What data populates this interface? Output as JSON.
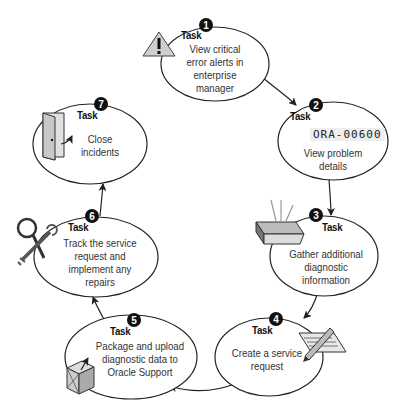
{
  "diagram": {
    "colors": {
      "stroke": "#222222",
      "badge": "#111111",
      "icon_gray": "#cccccc"
    },
    "steps": [
      {
        "number": "1",
        "label": "Task",
        "text": "View critical error alerts in enterprise manager",
        "lines": [
          "View critical",
          "error alerts in",
          "enterprise",
          "manager"
        ],
        "icon": "warning-icon"
      },
      {
        "number": "2",
        "label": "Task",
        "text": "View problem details",
        "lines": [
          "View problem",
          "details"
        ],
        "icon": "error-code",
        "code": "ORA-00600"
      },
      {
        "number": "3",
        "label": "Task",
        "text": "Gather additional diagnostic information",
        "lines": [
          "Gather additional",
          "diagnostic",
          "information"
        ],
        "icon": "collect-icon"
      },
      {
        "number": "4",
        "label": "Task",
        "text": "Create a service request",
        "lines": [
          "Create a service",
          "request"
        ],
        "icon": "document-pencil-icon"
      },
      {
        "number": "5",
        "label": "Task",
        "text": "Package and upload diagnostic data to Oracle Support",
        "lines": [
          "Package and upload",
          "diagnostic data to",
          "Oracle Support"
        ],
        "icon": "package-icon"
      },
      {
        "number": "6",
        "label": "Task",
        "text": "Track the service request and implement any repairs",
        "lines": [
          "Track the service",
          "request and",
          "implement any",
          "repairs"
        ],
        "icon": "tools-icon"
      },
      {
        "number": "7",
        "label": "Task",
        "text": "Close incidents",
        "lines": [
          "Close",
          "incidents"
        ],
        "icon": "door-icon"
      }
    ]
  }
}
